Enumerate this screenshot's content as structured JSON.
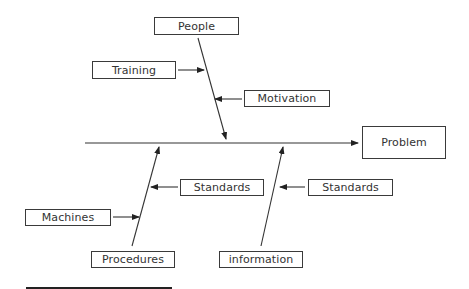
{
  "diagram": {
    "type": "fishbone",
    "effect": "Problem",
    "causes": {
      "top": {
        "label": "People",
        "sub_causes": [
          "Training",
          "Motivation"
        ]
      },
      "bottom_left": {
        "label": "Procedures",
        "sub_causes": [
          "Standards",
          "Machines"
        ]
      },
      "bottom_right": {
        "label": "information",
        "sub_causes": [
          "Standards"
        ]
      }
    }
  }
}
